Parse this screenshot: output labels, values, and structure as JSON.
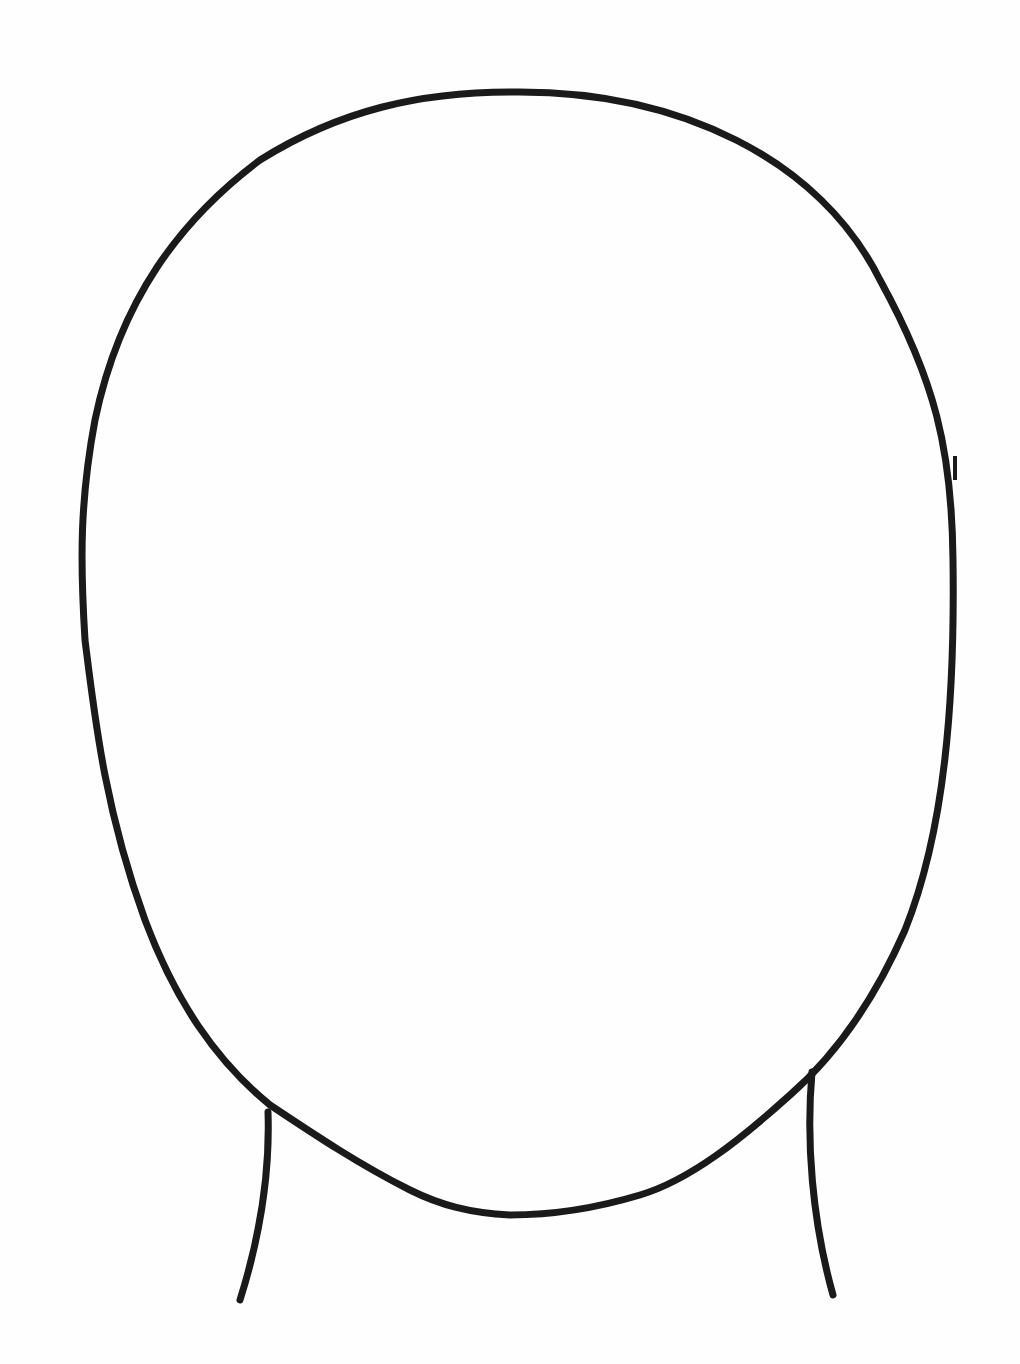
{
  "figure": {
    "title": "Blank face outline template",
    "stroke_color": "#1a1a1a",
    "background_color": "#ffffff",
    "stroke_width": 7,
    "parts": [
      "head-oval",
      "left-neck-line",
      "right-neck-line"
    ]
  }
}
